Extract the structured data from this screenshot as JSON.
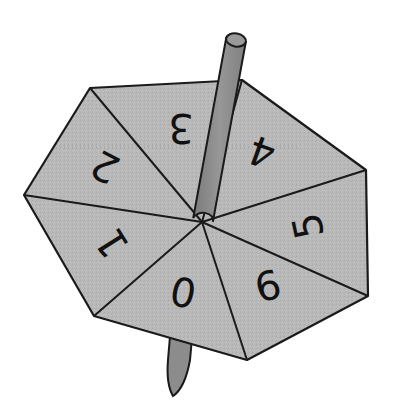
{
  "diagram": {
    "title": "Seven-sided spinner (teetotum)",
    "colors": {
      "face_fill": "#b9b9b9",
      "outline": "#1a1a1a",
      "rod_fill": "#8c8c8c",
      "rod_cap_fill": "#9a9a9a",
      "background": "#ffffff"
    },
    "center": [
      202,
      222
    ],
    "vertices": [
      [
        90,
        88
      ],
      [
        242,
        80
      ],
      [
        366,
        170
      ],
      [
        368,
        296
      ],
      [
        247,
        360
      ],
      [
        94,
        316
      ],
      [
        24,
        195
      ]
    ],
    "sectors": [
      {
        "label": "3",
        "x": 181,
        "y": 128,
        "rotate": 180
      },
      {
        "label": "4",
        "x": 262,
        "y": 152,
        "rotate": 200
      },
      {
        "label": "5",
        "x": 308,
        "y": 226,
        "rotate": 258
      },
      {
        "label": "6",
        "x": 268,
        "y": 286,
        "rotate": -14
      },
      {
        "label": "0",
        "x": 183,
        "y": 293,
        "rotate": 12
      },
      {
        "label": "1",
        "x": 112,
        "y": 243,
        "rotate": -122
      },
      {
        "label": "2",
        "x": 105,
        "y": 167,
        "rotate": -152
      }
    ],
    "rod": {
      "top": [
        236,
        40
      ],
      "bottom": [
        203,
        220
      ],
      "width": 20
    },
    "stick_below": {
      "top_left": [
        170,
        342
      ],
      "top_right": [
        191,
        343
      ],
      "tip": [
        172,
        396
      ]
    }
  }
}
